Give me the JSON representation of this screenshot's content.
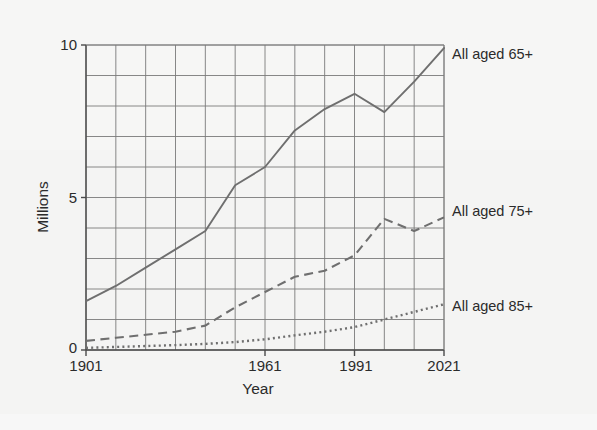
{
  "chart_data": {
    "type": "line",
    "title": "",
    "xlabel": "Year",
    "ylabel": "Millions",
    "xlim": [
      1901,
      2021
    ],
    "ylim": [
      0,
      10
    ],
    "xticks": [
      "1901",
      "1961",
      "1991",
      "2021"
    ],
    "xtick_values": [
      1901,
      1961,
      1991,
      2021
    ],
    "yticks": [
      "0",
      "5",
      "10"
    ],
    "ytick_values": [
      0,
      5,
      10
    ],
    "grid": true,
    "grid_x_step": 10,
    "grid_y_step": 1,
    "legend_position": "right-inline",
    "x": [
      1901,
      1911,
      1921,
      1931,
      1941,
      1951,
      1961,
      1971,
      1981,
      1991,
      2001,
      2011,
      2021
    ],
    "series": [
      {
        "name": "All aged 65+",
        "label": "All aged 65+",
        "style": "solid",
        "color": "#6f6f6f",
        "values": [
          1.6,
          2.1,
          2.7,
          3.3,
          3.9,
          5.4,
          6.0,
          7.2,
          7.9,
          8.4,
          7.8,
          8.8,
          9.9
        ]
      },
      {
        "name": "All aged 75+",
        "label": "All aged 75+",
        "style": "dashed",
        "color": "#6f6f6f",
        "values": [
          0.3,
          0.4,
          0.5,
          0.6,
          0.8,
          1.4,
          1.9,
          2.4,
          2.6,
          3.1,
          4.3,
          3.9,
          4.35
        ]
      },
      {
        "name": "All aged 85+",
        "label": "All aged 85+",
        "style": "dotted",
        "color": "#6f6f6f",
        "values": [
          0.07,
          0.1,
          0.13,
          0.16,
          0.2,
          0.26,
          0.35,
          0.48,
          0.6,
          0.75,
          1.0,
          1.25,
          1.5
        ]
      }
    ]
  },
  "axes": {
    "y_axis_title": "Millions",
    "x_axis_title": "Year",
    "y_tick_top": "10",
    "y_tick_mid": "5",
    "y_tick_bottom": "0",
    "x_tick_1": "1901",
    "x_tick_2": "1961",
    "x_tick_3": "1991",
    "x_tick_4": "2021"
  },
  "legend": {
    "item_1": "All aged 65+",
    "item_2": "All aged 75+",
    "item_3": "All aged 85+"
  },
  "colors": {
    "line": "#6f6f6f",
    "grid": "#7a7a7a",
    "axis": "#4a4a4a",
    "text": "#2b2b2b",
    "background": "#f4f4f3"
  }
}
